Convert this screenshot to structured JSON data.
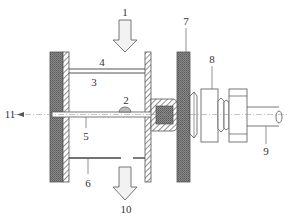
{
  "diagram": {
    "type": "mechanical-cross-section",
    "labels": {
      "l1": "1",
      "l2": "2",
      "l3": "3",
      "l4": "4",
      "l5": "5",
      "l6": "6",
      "l7": "7",
      "l8": "8",
      "l9": "9",
      "l10": "10",
      "l11": "11"
    },
    "colors": {
      "stroke": "#555555",
      "dark_hatch": "#6e6e6e",
      "light_fill": "#f4f4f4",
      "label": "#333333"
    }
  }
}
